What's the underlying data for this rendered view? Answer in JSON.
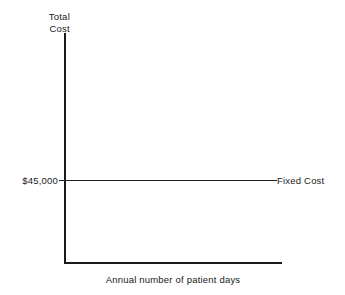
{
  "figure": {
    "background_color": "#ffffff",
    "ink_color": "#1a1a1a"
  },
  "chart_data": {
    "type": "line",
    "title": "",
    "subtitle": "",
    "xlabel": "Annual number of patient days",
    "ylabel": "Total Cost",
    "ylabel_lines": [
      "Total",
      "Cost"
    ],
    "grid": false,
    "legend_position": "inline-right",
    "x": [
      0,
      1
    ],
    "xtick_labels": [],
    "ytick_labels": [
      "$45,000"
    ],
    "ylim": [
      0,
      100000
    ],
    "annotations": [
      {
        "text": "Fixed Cost",
        "position": "right-end-of-line",
        "leader_line": true
      }
    ],
    "series": [
      {
        "name": "Fixed Cost",
        "values": [
          45000,
          45000
        ],
        "value_label": "$45,000",
        "color": "#1f1f1f",
        "style": "solid-horizontal"
      }
    ]
  }
}
